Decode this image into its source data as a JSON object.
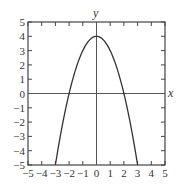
{
  "chart_data": {
    "type": "line",
    "title": "",
    "function": "y = 4 - x^2",
    "xlabel": "x",
    "ylabel": "y",
    "xlim": [
      -5,
      5
    ],
    "ylim": [
      -5,
      5
    ],
    "grid": false,
    "legend": null,
    "x_ticks": [
      -5,
      -4,
      -3,
      -2,
      -1,
      0,
      1,
      2,
      3,
      4,
      5
    ],
    "y_ticks": [
      -5,
      -4,
      -3,
      -2,
      -1,
      0,
      1,
      2,
      3,
      4,
      5
    ],
    "x_tick_labels": [
      "−5",
      "−4",
      "−3",
      "−2",
      "−1",
      "0",
      "1",
      "2",
      "3",
      "4",
      "5"
    ],
    "y_tick_labels": [
      "−5",
      "−4",
      "−3",
      "−2",
      "−1",
      "0",
      "1",
      "2",
      "3",
      "4",
      "5"
    ],
    "series": [
      {
        "name": "parabola",
        "x": [
          -3,
          -2.5,
          -2,
          -1.5,
          -1,
          -0.5,
          0,
          0.5,
          1,
          1.5,
          2,
          2.5,
          3
        ],
        "y": [
          -5,
          -2.25,
          0,
          1.75,
          3,
          3.75,
          4,
          3.75,
          3,
          1.75,
          0,
          -2.25,
          -5
        ]
      }
    ],
    "annotations": {
      "vertex": [
        0,
        4
      ],
      "x_intercepts": [
        -2,
        2
      ],
      "y_intercept": 4
    }
  },
  "style": {
    "line_color": "#333333",
    "frame_color": "#444444",
    "axis_color": "#555555"
  }
}
